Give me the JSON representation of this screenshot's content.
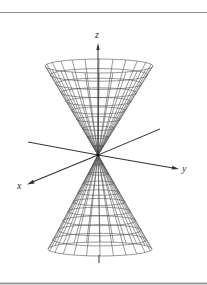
{
  "figure": {
    "axes": {
      "x_label": "x",
      "y_label": "y",
      "z_label": "z"
    },
    "colors": {
      "mesh": "#555555",
      "axis": "#333333",
      "rule": "#8a8a8a",
      "background": "#ffffff"
    },
    "mesh": {
      "radial_lines": 24,
      "rings_per_nappe": 10
    }
  }
}
